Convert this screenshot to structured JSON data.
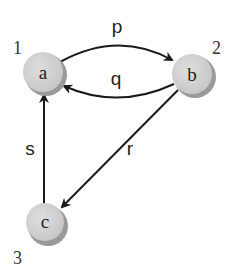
{
  "diagram": {
    "type": "directed-graph",
    "nodes": [
      {
        "id": "a",
        "label": "a",
        "number": "1"
      },
      {
        "id": "b",
        "label": "b",
        "number": "2"
      },
      {
        "id": "c",
        "label": "c",
        "number": "3"
      }
    ],
    "edges": [
      {
        "label": "p",
        "from": "a",
        "to": "b"
      },
      {
        "label": "q",
        "from": "b",
        "to": "a"
      },
      {
        "label": "r",
        "from": "b",
        "to": "c"
      },
      {
        "label": "s",
        "from": "c",
        "to": "a"
      }
    ],
    "colors": {
      "node_fill": "#d4d4d4",
      "node_shadow": "#9a9a9a",
      "edge": "#1a1a1a"
    }
  }
}
